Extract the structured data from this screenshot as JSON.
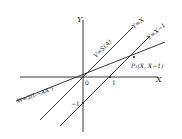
{
  "diagram": {
    "axes": {
      "x_label": "X",
      "y_label": "Y",
      "origin_label": "0",
      "x_tick_label": "1",
      "y_tick_label": "−1"
    },
    "lines": [
      {
        "id": "y_eq_x",
        "label": "Y=X"
      },
      {
        "id": "y_eq_x_minus_1",
        "label": "Y=X−1"
      },
      {
        "id": "v_subspace",
        "label": "V=S(A)"
      },
      {
        "id": "w_subspace",
        "label": "W=S(Iₙ−AA⁻)"
      }
    ],
    "point": {
      "label": "P₁(X, X−1)"
    },
    "colors": {
      "ink": "#222222",
      "background": "#ffffff"
    }
  }
}
